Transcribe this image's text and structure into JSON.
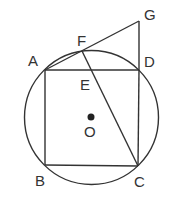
{
  "diagram": {
    "type": "geometry",
    "points": {
      "A": "A",
      "B": "B",
      "C": "C",
      "D": "D",
      "E": "E",
      "F": "F",
      "G": "G",
      "O": "O"
    },
    "segments": [
      "AB",
      "BC",
      "CD",
      "DA",
      "AG",
      "GD",
      "FC"
    ],
    "circle": {
      "center": "O",
      "through": [
        "A",
        "B",
        "C",
        "D"
      ]
    },
    "colors": {
      "stroke": "#333333",
      "background": "#ffffff"
    }
  }
}
